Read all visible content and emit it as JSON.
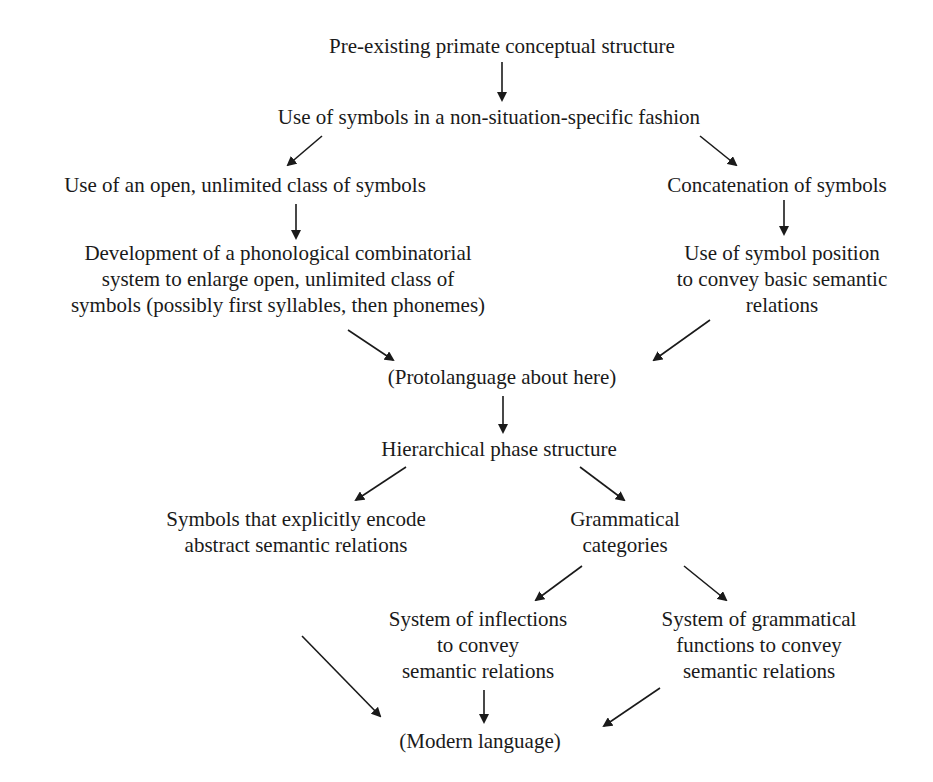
{
  "diagram": {
    "type": "flowchart",
    "nodes": {
      "n1": {
        "lines": [
          "Pre-existing primate conceptual structure"
        ]
      },
      "n2": {
        "lines": [
          "Use of symbols in a non-situation-specific fashion"
        ]
      },
      "n3": {
        "lines": [
          "Use of an open, unlimited class of symbols"
        ]
      },
      "n4": {
        "lines": [
          "Concatenation of symbols"
        ]
      },
      "n5": {
        "lines": [
          "Development of a phonological combinatorial",
          "system to enlarge open, unlimited class of",
          "symbols (possibly first syllables, then phonemes)"
        ]
      },
      "n6": {
        "lines": [
          "Use of symbol position",
          "to convey basic semantic",
          "relations"
        ]
      },
      "n7": {
        "lines": [
          "(Protolanguage about here)"
        ]
      },
      "n8": {
        "lines": [
          "Hierarchical phase structure"
        ]
      },
      "n9": {
        "lines": [
          "Symbols that explicitly encode",
          "abstract semantic relations"
        ]
      },
      "n10": {
        "lines": [
          "Grammatical",
          "categories"
        ]
      },
      "n11": {
        "lines": [
          "System of inflections",
          "to convey",
          "semantic relations"
        ]
      },
      "n12": {
        "lines": [
          "System of grammatical",
          "functions to convey",
          "semantic relations"
        ]
      },
      "n13": {
        "lines": [
          "(Modern language)"
        ]
      }
    },
    "edges": [
      [
        "n1",
        "n2"
      ],
      [
        "n2",
        "n3"
      ],
      [
        "n2",
        "n4"
      ],
      [
        "n3",
        "n5"
      ],
      [
        "n4",
        "n6"
      ],
      [
        "n5",
        "n7"
      ],
      [
        "n6",
        "n7"
      ],
      [
        "n7",
        "n8"
      ],
      [
        "n8",
        "n9"
      ],
      [
        "n8",
        "n10"
      ],
      [
        "n10",
        "n11"
      ],
      [
        "n10",
        "n12"
      ],
      [
        "n9",
        "n13"
      ],
      [
        "n11",
        "n13"
      ],
      [
        "n12",
        "n13"
      ]
    ],
    "colors": {
      "ink": "#1a1a1a",
      "background": "#ffffff"
    }
  }
}
